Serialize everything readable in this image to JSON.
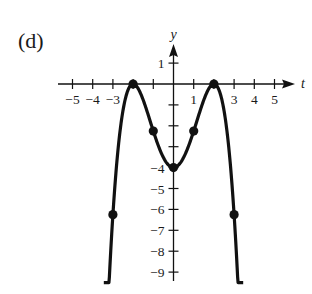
{
  "panel_label": "(d)",
  "chart_data": {
    "type": "line",
    "title": "",
    "panel": "(d)",
    "xlabel": "t",
    "ylabel": "y",
    "xlim": [
      -5.3,
      5.9
    ],
    "ylim": [
      -9.5,
      1.9
    ],
    "x_ticks": [
      -5,
      -4,
      -3,
      -2,
      -1,
      1,
      2,
      3,
      4,
      5
    ],
    "x_tick_labels": [
      "−5",
      "−4",
      "−3",
      "",
      "",
      "1",
      "",
      "3",
      "4",
      "5"
    ],
    "y_ticks": [
      1,
      -1,
      -2,
      -3,
      -4,
      -5,
      -6,
      -7,
      -8,
      -9
    ],
    "y_tick_labels": [
      "1",
      "",
      "",
      "",
      "−4",
      "−5",
      "−6",
      "−7",
      "−8",
      "−9"
    ],
    "grid": false,
    "legend": null,
    "series": [
      {
        "name": "y = -(t^2 - 4)^2 / 4",
        "curve_t_range": [
          -3.45,
          3.45
        ],
        "marked_points": [
          {
            "t": -3,
            "y": -6.25
          },
          {
            "t": -2,
            "y": 0
          },
          {
            "t": -1,
            "y": -2.25
          },
          {
            "t": 0,
            "y": -4
          },
          {
            "t": 1,
            "y": -2.25
          },
          {
            "t": 2,
            "y": 0
          },
          {
            "t": 3,
            "y": -6.25
          }
        ]
      }
    ]
  },
  "colors": {
    "ink": "#111111",
    "background": "#ffffff"
  }
}
